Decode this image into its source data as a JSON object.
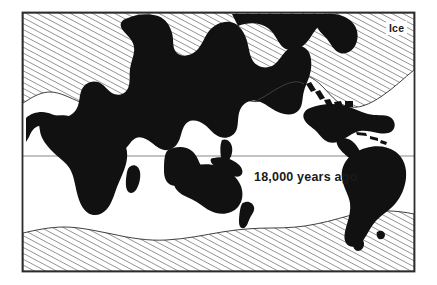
{
  "figure": {
    "type": "world-map-ice-age",
    "title": "",
    "frame": {
      "x": 22,
      "y": 12,
      "width": 393,
      "height": 260,
      "border_color": "#2b2b2b",
      "border_width": 2
    },
    "background_color": "#ffffff",
    "land_color": "#111111",
    "ice_fill_pattern": "diagonal-hatch",
    "ice_hatch_color": "#555555",
    "equator_line_color": "#6b6b6b"
  },
  "labels": {
    "ice": "Ice",
    "era": "18,000 years ago"
  },
  "legend": {
    "ice_label": "Ice"
  },
  "annotations": [
    {
      "name": "ice-sheet-label",
      "text": "Ice"
    },
    {
      "name": "time-period-label",
      "text": "18,000 years ago"
    }
  ],
  "map_features": {
    "equator_latitude": 0,
    "ice_regions": [
      "Northern Hemisphere ice sheet",
      "Antarctic ice sheet"
    ],
    "landmasses": [
      "Eurasia",
      "Africa",
      "North America",
      "South America",
      "Australia",
      "New Zealand",
      "Madagascar",
      "Greenland"
    ]
  }
}
